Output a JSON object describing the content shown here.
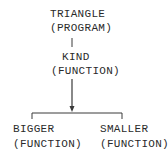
{
  "diagram": {
    "type": "hierarchy-tree",
    "root": {
      "name": "TRIANGLE",
      "kind": "(PROGRAM)"
    },
    "middle": {
      "name": "KIND",
      "kind": "(FUNCTION)"
    },
    "children": [
      {
        "name": "BIGGER",
        "kind": "(FUNCTION)"
      },
      {
        "name": "SMALLER",
        "kind": "(FUNCTION)"
      }
    ],
    "colors": {
      "text": "#2a2a2a",
      "lines": "#3a3a3a",
      "background": "#ffffff"
    }
  }
}
